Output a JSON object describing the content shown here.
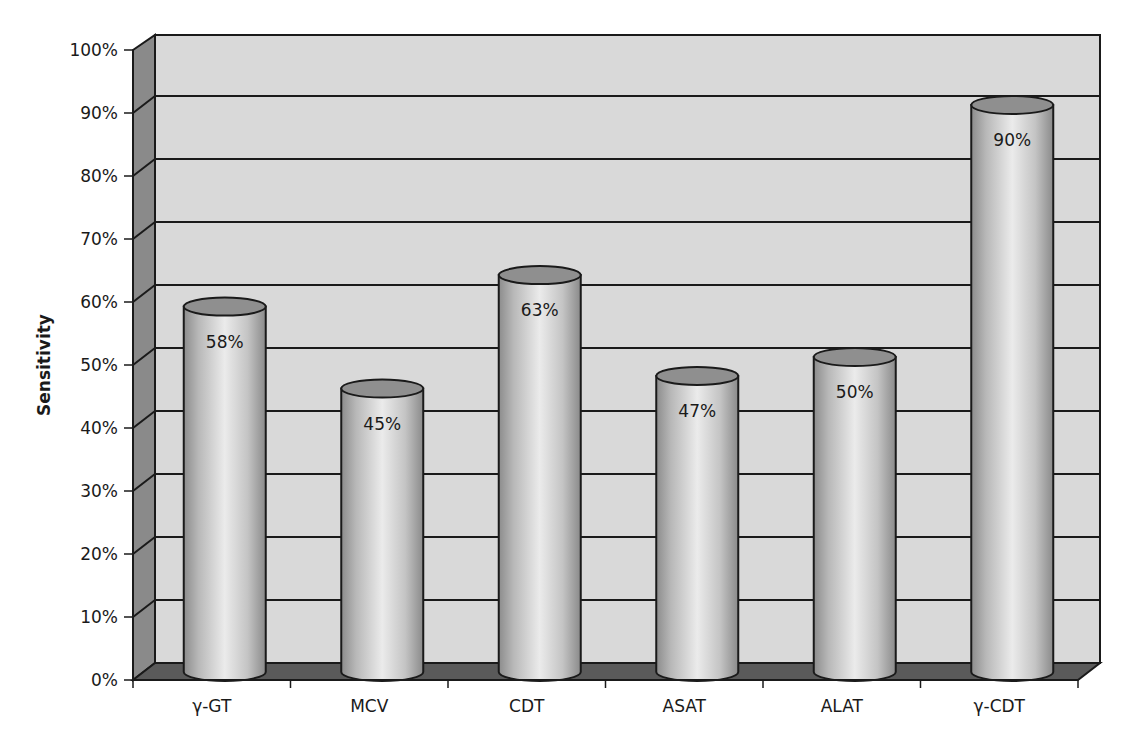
{
  "chart_data": {
    "type": "bar",
    "style": "3d-cylinder",
    "title": "",
    "xlabel": "",
    "ylabel": "Sensitivity",
    "ylim": [
      0,
      100
    ],
    "y_ticks": [
      "0%",
      "10%",
      "20%",
      "30%",
      "40%",
      "50%",
      "60%",
      "70%",
      "80%",
      "90%",
      "100%"
    ],
    "grid": true,
    "legend": null,
    "categories": [
      "γ-GT",
      "MCV",
      "CDT",
      "ASAT",
      "ALAT",
      "γ-CDT"
    ],
    "values": [
      58,
      45,
      63,
      47,
      50,
      90
    ],
    "value_labels": [
      "58%",
      "45%",
      "63%",
      "47%",
      "50%",
      "90%"
    ],
    "colors": {
      "wall": "#d9d9d9",
      "side_wall": "#8a8a8a",
      "floor": "#5a5a5a",
      "bar_light": "#e6e6e6",
      "bar_dark": "#8c8c8c",
      "bar_top": "#8f8f8f",
      "lines": "#1a1a1a"
    }
  }
}
